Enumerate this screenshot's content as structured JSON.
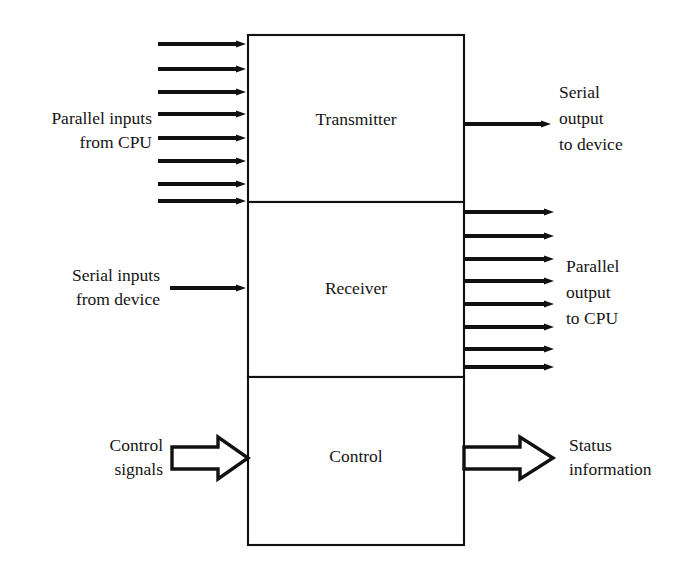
{
  "diagram": {
    "colors": {
      "stroke": "#111111",
      "background": "#ffffff",
      "text": "#141414"
    },
    "blocks": [
      {
        "id": "transmitter",
        "label": "Transmitter",
        "x": 248,
        "y": 35,
        "width": 216,
        "height": 167
      },
      {
        "id": "receiver",
        "label": "Receiver",
        "x": 248,
        "y": 202,
        "width": 216,
        "height": 175
      },
      {
        "id": "control",
        "label": "Control",
        "x": 248,
        "y": 377,
        "width": 216,
        "height": 168
      }
    ],
    "labels": [
      {
        "id": "parallel-inputs-from-cpu",
        "lines": [
          "Parallel inputs",
          "from CPU"
        ],
        "align": "right",
        "anchor_x": 152,
        "first_line_y": 124
      },
      {
        "id": "serial-output-to-device",
        "lines": [
          "Serial",
          "output",
          "to device"
        ],
        "align": "left",
        "anchor_x": 559,
        "first_line_y": 98
      },
      {
        "id": "serial-inputs-from-device",
        "lines": [
          "Serial inputs",
          "from device"
        ],
        "align": "right",
        "anchor_x": 160,
        "first_line_y": 281
      },
      {
        "id": "parallel-output-to-cpu",
        "lines": [
          "Parallel",
          "output",
          "to CPU"
        ],
        "align": "left",
        "anchor_x": 566,
        "first_line_y": 272
      },
      {
        "id": "control-signals",
        "lines": [
          "Control",
          "signals"
        ],
        "align": "right",
        "anchor_x": 163,
        "first_line_y": 451
      },
      {
        "id": "status-information",
        "lines": [
          "Status",
          "information"
        ],
        "align": "left",
        "anchor_x": 569,
        "first_line_y": 451
      }
    ],
    "arrow_groups": [
      {
        "id": "parallel-input-bus",
        "style": "thin-solid",
        "direction": "right",
        "count": 8,
        "x_start": 158,
        "x_end": 248,
        "y_values": [
          44,
          69,
          92,
          114,
          138,
          161,
          184,
          201
        ]
      },
      {
        "id": "parallel-output-bus",
        "style": "thin-solid",
        "direction": "right",
        "count": 8,
        "x_start": 464,
        "x_end": 556,
        "y_values": [
          212,
          236,
          259,
          281,
          304,
          327,
          349,
          367
        ]
      }
    ],
    "single_arrows": [
      {
        "id": "serial-output-arrow",
        "style": "thin-solid",
        "direction": "right",
        "x_start": 464,
        "x_end": 553,
        "y": 124
      },
      {
        "id": "serial-input-arrow",
        "style": "thin-solid",
        "direction": "right",
        "x_start": 170,
        "x_end": 248,
        "y": 288
      },
      {
        "id": "control-signals-arrow",
        "style": "block-hollow",
        "direction": "right",
        "x_start": 172,
        "x_end": 248,
        "y": 458
      },
      {
        "id": "status-information-arrow",
        "style": "block-hollow",
        "direction": "right",
        "x_start": 464,
        "x_end": 553,
        "y": 458
      }
    ]
  }
}
